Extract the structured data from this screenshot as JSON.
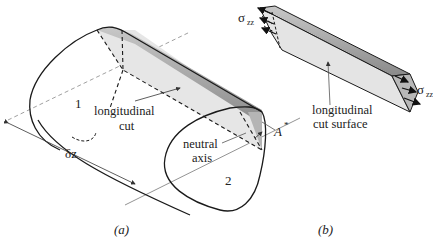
{
  "figure": {
    "panel_a": {
      "caption": "(a)",
      "labels": {
        "section_1": "1",
        "section_2": "2",
        "longitudinal_cut_line1": "longitudinal",
        "longitudinal_cut_line2": "cut",
        "neutral_axis_line1": "neutral",
        "neutral_axis_line2": "axis",
        "length": "δz",
        "area": "A",
        "area_superscript": "*"
      }
    },
    "panel_b": {
      "caption": "(b)",
      "labels": {
        "stress_left": "σ",
        "stress_left_sub": "zz",
        "stress_right": "σ",
        "stress_right_sub": "zz",
        "surface_line1": "longitudinal",
        "surface_line2": "cut surface"
      }
    },
    "colors": {
      "stroke": "#1a1a1a",
      "face_light": "#e4e4e4",
      "face_dark": "#9a9a9a",
      "thin_line": "#666666"
    }
  }
}
